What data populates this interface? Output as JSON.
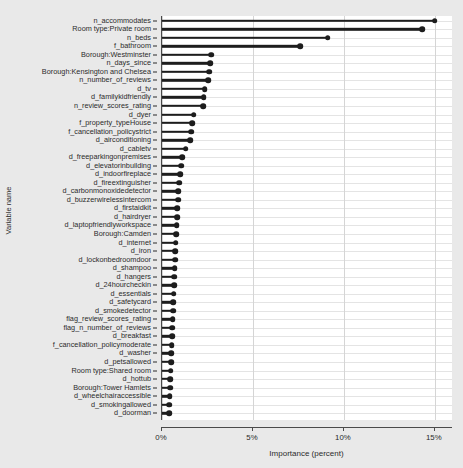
{
  "chart_data": {
    "type": "bar",
    "subtype": "lollipop-horizontal",
    "title": "",
    "xlabel": "Importance (percent)",
    "ylabel": "Variable name",
    "xlim": [
      0,
      16.0
    ],
    "xticks": [
      0,
      5,
      10,
      15
    ],
    "xtick_labels": [
      "0%",
      "5%",
      "10%",
      "15%"
    ],
    "grid": "horizontal-and-vertical-light",
    "legend": "none",
    "orientation": "horizontal",
    "sorted": "descending",
    "categories": [
      "n_accommodates",
      "Room type:Private room",
      "n_beds",
      "f_bathroom",
      "Borough:Westminster",
      "n_days_since",
      "Borough:Kensington and Chelsea",
      "n_number_of_reviews",
      "d_tv",
      "d_familykidfriendly",
      "n_review_scores_rating",
      "d_dyer",
      "f_property_typeHouse",
      "f_cancellation_policystrict",
      "d_airconditioning",
      "d_cabletv",
      "d_freeparkingonpremises",
      "d_elevatorinbuilding",
      "d_indoorfireplace",
      "d_fireextinguisher",
      "d_carbonmonoxidedetector",
      "d_buzzerwirelessintercom",
      "d_firstaidkit",
      "d_hairdryer",
      "d_laptopfriendlyworkspace",
      "Borough:Camden",
      "d_internet",
      "d_iron",
      "d_lockonbedroomdoor",
      "d_shampoo",
      "d_hangers",
      "d_24hourcheckin",
      "d_essentials",
      "d_safetycard",
      "d_smokedetector",
      "flag_review_scores_rating",
      "flag_n_number_of_reviews",
      "d_breakfast",
      "f_cancellation_policymoderate",
      "d_washer",
      "d_petsallowed",
      "Room type:Shared room",
      "d_hottub",
      "Borough:Tower Hamlets",
      "d_wheelchairaccessible",
      "d_smokingallowed",
      "d_doorman"
    ],
    "values": [
      15.0,
      14.3,
      9.1,
      7.6,
      2.7,
      2.65,
      2.6,
      2.55,
      2.35,
      2.3,
      2.25,
      1.75,
      1.65,
      1.6,
      1.55,
      1.3,
      1.1,
      1.05,
      1.0,
      0.95,
      0.9,
      0.88,
      0.85,
      0.82,
      0.8,
      0.78,
      0.76,
      0.74,
      0.72,
      0.7,
      0.68,
      0.66,
      0.64,
      0.62,
      0.6,
      0.58,
      0.56,
      0.55,
      0.54,
      0.52,
      0.5,
      0.48,
      0.46,
      0.44,
      0.42,
      0.4,
      0.38
    ],
    "colors": {
      "marker": "#1d1d1d",
      "stem": "#1d1d1d",
      "panel_background": "#ffffff",
      "figure_background": "#e9e9e9",
      "gridline": "#e4e4e4",
      "axis": "#4a4a4a",
      "text": "#2b2b2b"
    }
  }
}
